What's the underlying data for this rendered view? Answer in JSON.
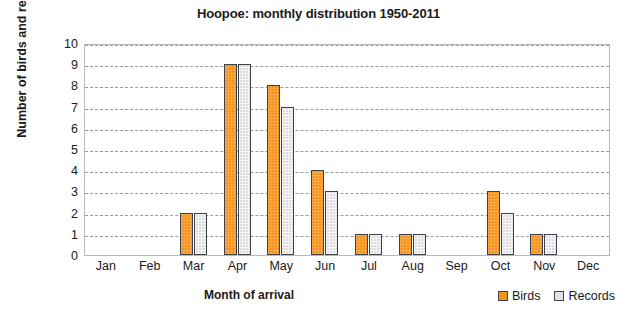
{
  "chart_data": {
    "type": "bar",
    "title": "Hoopoe: monthly distribution 1950-2011",
    "xlabel": "Month of arrival",
    "ylabel": "Number of birds and records",
    "categories": [
      "Jan",
      "Feb",
      "Mar",
      "Apr",
      "May",
      "Jun",
      "Jul",
      "Aug",
      "Sep",
      "Oct",
      "Nov",
      "Dec"
    ],
    "series": [
      {
        "name": "Birds",
        "color": "#F7941E",
        "values": [
          0,
          0,
          2,
          9,
          8,
          4,
          1,
          1,
          0,
          3,
          1,
          0
        ]
      },
      {
        "name": "Records",
        "color": "#DDDDDD",
        "values": [
          0,
          0,
          2,
          9,
          7,
          3,
          1,
          1,
          0,
          2,
          1,
          0
        ]
      }
    ],
    "ylim": [
      0,
      10
    ],
    "yticks": [
      0,
      1,
      2,
      3,
      4,
      5,
      6,
      7,
      8,
      9,
      10
    ],
    "ytick_labels": [
      "0",
      "1",
      "2",
      "3",
      "4",
      "5",
      "6",
      "7",
      "8",
      "9",
      "10"
    ],
    "grid": true,
    "grid_style": "dashed-horizontal",
    "legend_position": "bottom-right",
    "bar_outline_color": "#3C4049",
    "plot_border_color": "#B9B9B9",
    "background": "#FFFFFF"
  },
  "legend": {
    "items": [
      {
        "label": "Birds"
      },
      {
        "label": "Records"
      }
    ]
  }
}
